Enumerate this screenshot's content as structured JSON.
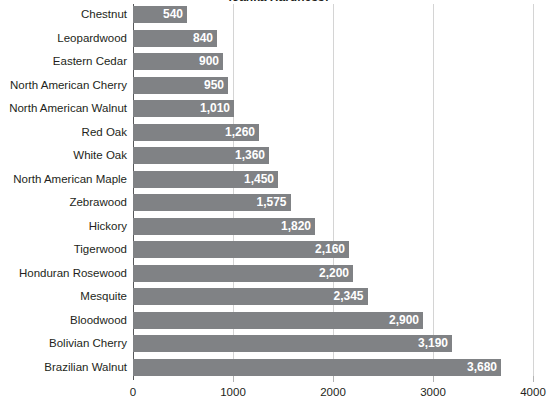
{
  "chart_data": {
    "type": "bar",
    "orientation": "horizontal",
    "title": "(Janka Hardness)",
    "xlabel": "",
    "ylabel": "",
    "xlim": [
      0,
      4000
    ],
    "xticks": [
      0,
      1000,
      2000,
      3000,
      4000
    ],
    "xtick_labels": [
      "0",
      "1000",
      "2000",
      "3000",
      "4000"
    ],
    "grid": true,
    "grid_axis": "x",
    "legend": false,
    "bar_color": "#808285",
    "value_label_color": "#ffffff",
    "gridline_color": "#d4d4d4",
    "axis_color": "#58595b",
    "text_color": "#231f20",
    "categories": [
      "Chestnut",
      "Leopardwood",
      "Eastern Cedar",
      "North American Cherry",
      "North American Walnut",
      "Red Oak",
      "White Oak",
      "North American Maple",
      "Zebrawood",
      "Hickory",
      "Tigerwood",
      "Honduran Rosewood",
      "Mesquite",
      "Bloodwood",
      "Bolivian Cherry",
      "Brazilian Walnut"
    ],
    "values": [
      540,
      840,
      900,
      950,
      1010,
      1260,
      1360,
      1450,
      1575,
      1820,
      2160,
      2200,
      2345,
      2900,
      3190,
      3680
    ],
    "value_labels": [
      "540",
      "840",
      "900",
      "950",
      "1,010",
      "1,260",
      "1,360",
      "1,450",
      "1,575",
      "1,820",
      "2,160",
      "2,200",
      "2,345",
      "2,900",
      "3,190",
      "3,680"
    ]
  }
}
